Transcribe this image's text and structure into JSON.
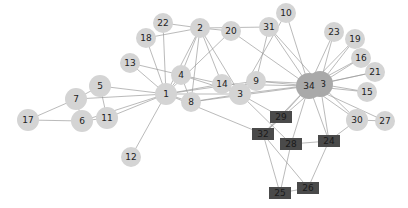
{
  "graph": {
    "title": "",
    "colors": {
      "background": "#ffffff",
      "edge": "#9a9a9a",
      "circle_node": "#d4d4d4",
      "hub_node": "#a9a9a9",
      "square_node": "#4a4a4a",
      "label": "#222222"
    },
    "nodes": [
      {
        "id": "1",
        "x": 166,
        "y": 94,
        "shape": "circle",
        "r": 11
      },
      {
        "id": "2",
        "x": 200,
        "y": 28,
        "shape": "circle",
        "r": 10
      },
      {
        "id": "3",
        "x": 240,
        "y": 94,
        "shape": "circle",
        "r": 11
      },
      {
        "id": "4",
        "x": 181,
        "y": 75,
        "shape": "circle",
        "r": 10
      },
      {
        "id": "5",
        "x": 100,
        "y": 86,
        "shape": "circle",
        "r": 11
      },
      {
        "id": "6",
        "x": 82,
        "y": 121,
        "shape": "circle",
        "r": 11
      },
      {
        "id": "7",
        "x": 76,
        "y": 99,
        "shape": "circle",
        "r": 11
      },
      {
        "id": "8",
        "x": 191,
        "y": 102,
        "shape": "circle",
        "r": 10
      },
      {
        "id": "9",
        "x": 256,
        "y": 81,
        "shape": "circle",
        "r": 10
      },
      {
        "id": "10",
        "x": 286,
        "y": 13,
        "shape": "circle",
        "r": 10
      },
      {
        "id": "11",
        "x": 107,
        "y": 118,
        "shape": "circle",
        "r": 11
      },
      {
        "id": "12",
        "x": 131,
        "y": 157,
        "shape": "circle",
        "r": 10
      },
      {
        "id": "13",
        "x": 130,
        "y": 63,
        "shape": "circle",
        "r": 10
      },
      {
        "id": "14",
        "x": 222,
        "y": 84,
        "shape": "circle",
        "r": 10
      },
      {
        "id": "15",
        "x": 367,
        "y": 92,
        "shape": "circle",
        "r": 10
      },
      {
        "id": "16",
        "x": 361,
        "y": 58,
        "shape": "circle",
        "r": 10
      },
      {
        "id": "17",
        "x": 28,
        "y": 120,
        "shape": "circle",
        "r": 11
      },
      {
        "id": "18",
        "x": 146,
        "y": 38,
        "shape": "circle",
        "r": 10
      },
      {
        "id": "19",
        "x": 355,
        "y": 39,
        "shape": "circle",
        "r": 10
      },
      {
        "id": "20",
        "x": 231,
        "y": 31,
        "shape": "circle",
        "r": 10
      },
      {
        "id": "21",
        "x": 375,
        "y": 72,
        "shape": "circle",
        "r": 10
      },
      {
        "id": "22",
        "x": 163,
        "y": 23,
        "shape": "circle",
        "r": 10
      },
      {
        "id": "23",
        "x": 334,
        "y": 32,
        "shape": "circle",
        "r": 10
      },
      {
        "id": "24",
        "x": 329,
        "y": 141,
        "shape": "rect"
      },
      {
        "id": "25",
        "x": 280,
        "y": 193,
        "shape": "rect"
      },
      {
        "id": "26",
        "x": 308,
        "y": 188,
        "shape": "rect"
      },
      {
        "id": "27",
        "x": 385,
        "y": 121,
        "shape": "circle",
        "r": 10
      },
      {
        "id": "28",
        "x": 291,
        "y": 144,
        "shape": "rect"
      },
      {
        "id": "29",
        "x": 281,
        "y": 117,
        "shape": "rect"
      },
      {
        "id": "30",
        "x": 357,
        "y": 120,
        "shape": "circle",
        "r": 11
      },
      {
        "id": "31",
        "x": 269,
        "y": 27,
        "shape": "circle",
        "r": 10
      },
      {
        "id": "32",
        "x": 263,
        "y": 134,
        "shape": "rect"
      },
      {
        "id": "33",
        "x": 320,
        "y": 84,
        "shape": "circle",
        "r": 13,
        "hub": true
      },
      {
        "id": "34",
        "x": 309,
        "y": 86,
        "shape": "circle",
        "r": 13,
        "hub": true
      }
    ],
    "edges": [
      [
        "1",
        "2"
      ],
      [
        "1",
        "3"
      ],
      [
        "1",
        "4"
      ],
      [
        "1",
        "5"
      ],
      [
        "1",
        "6"
      ],
      [
        "1",
        "7"
      ],
      [
        "1",
        "8"
      ],
      [
        "1",
        "9"
      ],
      [
        "1",
        "11"
      ],
      [
        "1",
        "12"
      ],
      [
        "1",
        "13"
      ],
      [
        "1",
        "14"
      ],
      [
        "1",
        "18"
      ],
      [
        "1",
        "20"
      ],
      [
        "1",
        "22"
      ],
      [
        "1",
        "32"
      ],
      [
        "2",
        "3"
      ],
      [
        "2",
        "4"
      ],
      [
        "2",
        "8"
      ],
      [
        "2",
        "14"
      ],
      [
        "2",
        "18"
      ],
      [
        "2",
        "20"
      ],
      [
        "2",
        "22"
      ],
      [
        "2",
        "31"
      ],
      [
        "3",
        "4"
      ],
      [
        "3",
        "8"
      ],
      [
        "3",
        "9"
      ],
      [
        "3",
        "10"
      ],
      [
        "3",
        "14"
      ],
      [
        "3",
        "28"
      ],
      [
        "3",
        "29"
      ],
      [
        "3",
        "33"
      ],
      [
        "4",
        "8"
      ],
      [
        "4",
        "13"
      ],
      [
        "4",
        "14"
      ],
      [
        "5",
        "7"
      ],
      [
        "5",
        "11"
      ],
      [
        "6",
        "7"
      ],
      [
        "6",
        "11"
      ],
      [
        "6",
        "17"
      ],
      [
        "7",
        "17"
      ],
      [
        "9",
        "31"
      ],
      [
        "9",
        "33"
      ],
      [
        "9",
        "34"
      ],
      [
        "10",
        "34"
      ],
      [
        "14",
        "34"
      ],
      [
        "15",
        "33"
      ],
      [
        "15",
        "34"
      ],
      [
        "16",
        "33"
      ],
      [
        "16",
        "34"
      ],
      [
        "19",
        "33"
      ],
      [
        "19",
        "34"
      ],
      [
        "20",
        "34"
      ],
      [
        "21",
        "33"
      ],
      [
        "21",
        "34"
      ],
      [
        "23",
        "33"
      ],
      [
        "23",
        "34"
      ],
      [
        "24",
        "26"
      ],
      [
        "24",
        "28"
      ],
      [
        "24",
        "30"
      ],
      [
        "24",
        "33"
      ],
      [
        "24",
        "34"
      ],
      [
        "25",
        "26"
      ],
      [
        "25",
        "28"
      ],
      [
        "25",
        "32"
      ],
      [
        "26",
        "32"
      ],
      [
        "27",
        "30"
      ],
      [
        "27",
        "34"
      ],
      [
        "29",
        "32"
      ],
      [
        "29",
        "34"
      ],
      [
        "30",
        "33"
      ],
      [
        "30",
        "34"
      ],
      [
        "31",
        "33"
      ],
      [
        "31",
        "34"
      ],
      [
        "32",
        "33"
      ],
      [
        "32",
        "34"
      ],
      [
        "33",
        "34"
      ],
      [
        "28",
        "34"
      ],
      [
        "8",
        "34"
      ]
    ]
  }
}
